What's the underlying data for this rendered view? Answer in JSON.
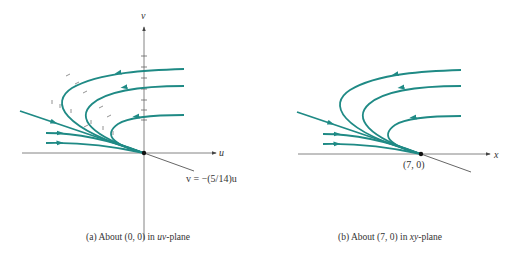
{
  "colors": {
    "trajectory": "#1f8a85",
    "axis": "#555555",
    "text": "#333333",
    "background": "#ffffff"
  },
  "panel_a": {
    "caption_prefix": "(a) About (0, 0) in ",
    "caption_var": "uv",
    "caption_suffix": "-plane",
    "x_axis_label": "u",
    "y_axis_label": "v",
    "line_label": "v = −(5/14)u",
    "origin_marker": "critical-point-dot"
  },
  "panel_b": {
    "caption_prefix": "(b) About (7, 0) in ",
    "caption_var": "xy",
    "caption_suffix": "-plane",
    "x_axis_label": "x",
    "point_label": "(7, 0)",
    "origin_marker": "critical-point-dot"
  }
}
